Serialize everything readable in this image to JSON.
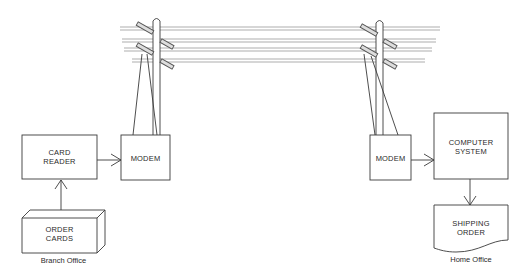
{
  "diagram": {
    "nodes": {
      "card_reader": {
        "label": "CARD\nREADER"
      },
      "order_cards": {
        "label": "ORDER\nCARDS"
      },
      "modem_left": {
        "label": "MODEM"
      },
      "modem_right": {
        "label": "MODEM"
      },
      "computer_system": {
        "label": "COMPUTER\nSYSTEM"
      },
      "shipping_order": {
        "label": "SHIPPING\nORDER"
      }
    },
    "captions": {
      "branch": "Branch Office",
      "home": "Home Office"
    },
    "edges": [
      {
        "from": "order_cards",
        "to": "card_reader"
      },
      {
        "from": "card_reader",
        "to": "modem_left"
      },
      {
        "from": "modem_left",
        "to": "modem_right",
        "via": "telephone lines"
      },
      {
        "from": "modem_right",
        "to": "computer_system"
      },
      {
        "from": "computer_system",
        "to": "shipping_order"
      }
    ],
    "colors": {
      "stroke": "#3a3a3a",
      "wire": "#8a8a8a",
      "background": "#ffffff"
    }
  }
}
